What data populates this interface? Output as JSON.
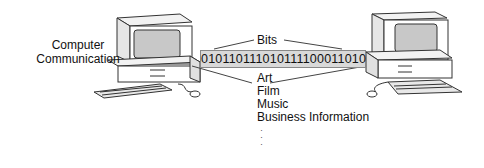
{
  "diagram": {
    "title_lines": [
      "Computer",
      "Communication"
    ],
    "bits_label": "Bits",
    "bit_stream": "0101101110101110001101 0",
    "bit_stream_clean": "010110111010111100011010",
    "content_types": [
      "Art",
      "Film",
      "Music",
      "Business Information"
    ],
    "continuation": "⋮",
    "nodes": [
      {
        "name": "left-computer",
        "type": "desktop computer with monitor, keyboard and mouse"
      },
      {
        "name": "right-computer",
        "type": "desktop computer with monitor, keyboard and mouse"
      }
    ],
    "colors": {
      "screen": "#c8c8c8",
      "band": "#d9d9d9",
      "stroke": "#333333"
    }
  }
}
